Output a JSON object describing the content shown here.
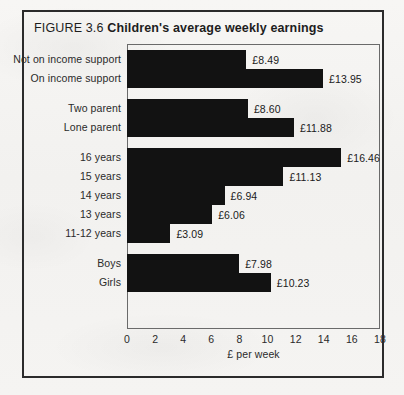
{
  "figure": {
    "number": "FIGURE 3.6",
    "title": "Children's average weekly earnings"
  },
  "chart_data": {
    "type": "bar",
    "orientation": "horizontal",
    "title": "Children's average weekly earnings",
    "xlabel": "£ per week",
    "ylabel": "",
    "xlim": [
      0,
      18
    ],
    "xticks": [
      "0",
      "2",
      "4",
      "6",
      "8",
      "10",
      "12",
      "14",
      "16",
      "18"
    ],
    "grid": false,
    "legend": "none",
    "bar_color": "#121212",
    "categories": [
      "Not on income support",
      "On income support",
      "Two parent",
      "Lone parent",
      "16 years",
      "15 years",
      "14 years",
      "13 years",
      "11-12 years",
      "Boys",
      "Girls"
    ],
    "values": [
      8.49,
      13.95,
      8.6,
      11.88,
      16.46,
      11.13,
      6.94,
      6.06,
      3.09,
      7.98,
      10.23
    ],
    "value_labels": [
      "£8.49",
      "£13.95",
      "£8.60",
      "£11.88",
      "£16.46",
      "£11.13",
      "£6.94",
      "£6.06",
      "£3.09",
      "£7.98",
      "£10.23"
    ],
    "groups": [
      {
        "name": "income-support",
        "indices": [
          0,
          1
        ]
      },
      {
        "name": "family-type",
        "indices": [
          2,
          3
        ]
      },
      {
        "name": "age",
        "indices": [
          4,
          5,
          6,
          7,
          8
        ]
      },
      {
        "name": "gender",
        "indices": [
          9,
          10
        ]
      }
    ]
  }
}
